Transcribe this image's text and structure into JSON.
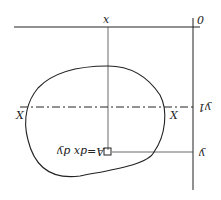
{
  "labels": {
    "origin": "0",
    "x_axis": "x",
    "centroid_axis_left": "X",
    "centroid_axis_right": "X",
    "y1": "y1",
    "y": "y",
    "area_element": "A=dx dy"
  },
  "colors": {
    "line": "#222222",
    "background": "#ffffff"
  }
}
